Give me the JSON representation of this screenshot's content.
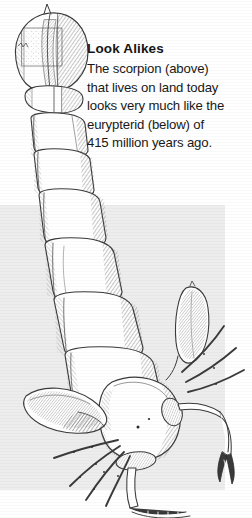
{
  "page": {
    "background_color": "#ffffff",
    "width": 252,
    "height": 518
  },
  "backdrop_panel": {
    "name": "gray-backdrop-panel",
    "color": "#ededed"
  },
  "caption": {
    "title": "Look Alikes",
    "lines": [
      "The scorpion (above)",
      "that lives on land today",
      "looks very much like the",
      "eurypterid (below) of",
      "415 million years ago."
    ],
    "full_text": "The scorpion (above) that lives on land today looks very much like the eurypterid (below) of 415 million years ago.",
    "text_color": "#191919"
  },
  "illustration": {
    "subject": "scorpion",
    "style": "pen-and-ink cross-hatch engraving",
    "ink_color": "#3a3a3a",
    "fill_color": "#ffffff",
    "parts": [
      "telson-stinger-bulb",
      "tail-segment-1",
      "tail-segment-2",
      "tail-segment-3",
      "tail-segment-4",
      "tail-segment-5",
      "mesosoma-segments",
      "cephalothorax",
      "left-pedipalp-claw",
      "right-pedipalp-claw",
      "walking-legs",
      "eyes"
    ]
  }
}
